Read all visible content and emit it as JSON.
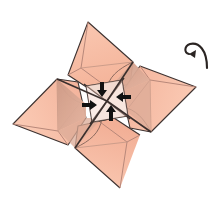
{
  "figure": {
    "kind": "origami-diagram",
    "width": 211,
    "height": 209,
    "background_color": "#FFFFFF",
    "colors": {
      "paper_front": "#F7BBA2",
      "paper_front_light": "#FAC9B3",
      "paper_shadow": "#D9A48F",
      "paper_shadow_dark": "#C0907E",
      "paper_white": "#FFFFFF",
      "outline": "#3D3230",
      "crease": "#B8887A",
      "arrow": "#111111"
    },
    "petals": [
      {
        "name": "top-petal",
        "label": "top flap"
      },
      {
        "name": "right-petal",
        "label": "right flap"
      },
      {
        "name": "bottom-petal",
        "label": "bottom flap"
      },
      {
        "name": "left-petal",
        "label": "left flap"
      }
    ],
    "arrows": [
      {
        "name": "arrow-up",
        "direction": "up",
        "label": "fold toward center (from bottom)"
      },
      {
        "name": "arrow-right",
        "direction": "right",
        "label": "fold toward center (from left)"
      },
      {
        "name": "arrow-down",
        "direction": "down",
        "label": "fold toward center (from top)"
      },
      {
        "name": "arrow-left",
        "direction": "left",
        "label": "fold toward center (from right)"
      }
    ],
    "rotate_symbol": {
      "name": "rotate-arrow-icon",
      "label": "rotate / turn model"
    },
    "center_square": {
      "name": "center-square",
      "label": "central square with diagonal creases"
    }
  }
}
